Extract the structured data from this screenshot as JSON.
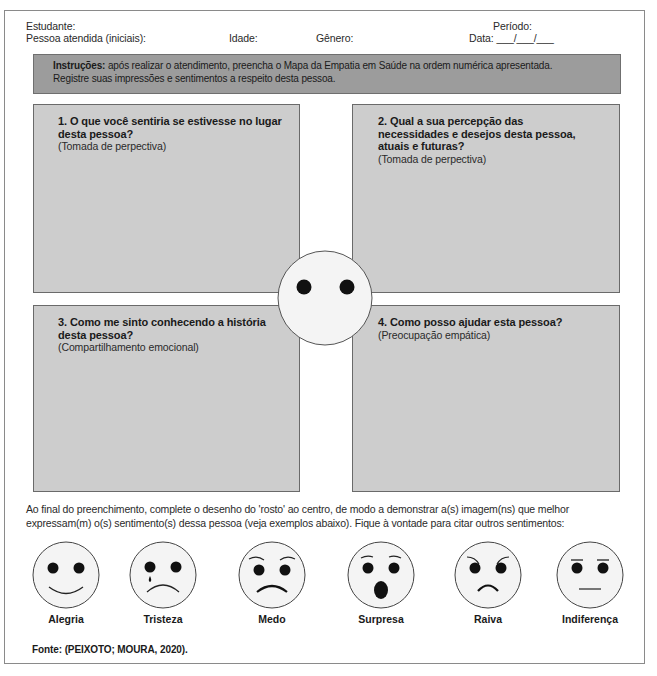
{
  "header": {
    "estudante_label": "Estudante:",
    "pessoa_label": "Pessoa atendida (iniciais):",
    "idade_label": "Idade:",
    "genero_label": "Gênero:",
    "periodo_label": "Período:",
    "data_label": "Data: ___/___/___"
  },
  "instructions": {
    "bold": "Instruções:",
    "line1": " após realizar o atendimento, preencha o Mapa da Empatia em Saúde na ordem numérica apresentada.",
    "line2": "Registre suas impressões e sentimentos a respeito desta pessoa."
  },
  "quadrants": [
    {
      "title": "1. O que você sentiria se estivesse no lugar desta pessoa?",
      "subtitle": "(Tomada de perpectiva)"
    },
    {
      "title": "2. Qual a sua percepção das necessidades e desejos desta pessoa, atuais e futuras?",
      "subtitle": "(Tomada de perpectiva)"
    },
    {
      "title": "3. Como me sinto conhecendo a história desta pessoa?",
      "subtitle": "(Compartilhamento emocional)"
    },
    {
      "title": "4. Como posso ajudar esta pessoa?",
      "subtitle": "(Preocupação empática)"
    }
  ],
  "bottom_text": "Ao final do preenchimento, complete o desenho do 'rosto' ao centro, de modo a demonstrar a(s) imagem(ns) que melhor expressam(m) o(s) sentimento(s) dessa pessoa (veja exemplos abaixo). Fique à vontade para citar outros sentimentos:",
  "faces": [
    {
      "label": "Alegria",
      "icon": "happy-face-icon"
    },
    {
      "label": "Tristeza",
      "icon": "sad-crying-face-icon"
    },
    {
      "label": "Medo",
      "icon": "fear-face-icon"
    },
    {
      "label": "Surpresa",
      "icon": "surprise-face-icon"
    },
    {
      "label": "Raiva",
      "icon": "angry-face-icon"
    },
    {
      "label": "Indiferença",
      "icon": "neutral-face-icon"
    }
  ],
  "source": "Fonte: (PEIXOTO; MOURA, 2020).",
  "colors": {
    "instructions_bg": "#9c9c9c",
    "quadrant_bg": "#cdcdcd",
    "face_fill": "#f4f4f4",
    "border": "#6a6a6a"
  }
}
